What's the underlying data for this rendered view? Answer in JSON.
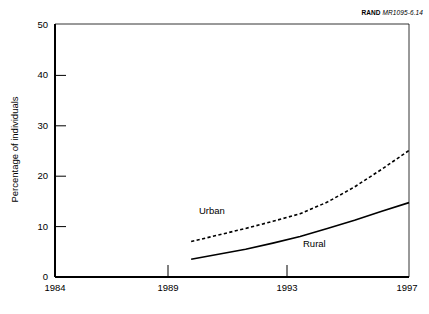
{
  "source_credit": {
    "organization": "RAND",
    "figure_id": "MR1095-6.14"
  },
  "axes": {
    "ylabel": "Percentage of individuals",
    "xlabel": "",
    "y_ticks": [
      "0",
      "10",
      "20",
      "30",
      "40",
      "50"
    ],
    "x_ticks": [
      "1984",
      "1989",
      "1993",
      "1997"
    ]
  },
  "labels": {
    "urban": "Urban",
    "rural": "Rural"
  },
  "colors": {
    "line": "#000000",
    "axis": "#000000",
    "background": "#ffffff"
  },
  "chart_data": {
    "type": "line",
    "title": "",
    "subtitle": "",
    "xlabel": "",
    "ylabel": "Percentage of individuals",
    "xlim": [
      1984,
      1997
    ],
    "ylim": [
      0,
      50
    ],
    "x_ticks": [
      1984,
      1989,
      1993,
      1997
    ],
    "y_ticks": [
      0,
      10,
      20,
      30,
      40,
      50
    ],
    "grid": false,
    "legend": "inline-annotations",
    "annotations": [
      {
        "text": "Urban",
        "x": 1990.9,
        "y": 15.4
      },
      {
        "text": "Rural",
        "x": 1994.6,
        "y": 9.0
      }
    ],
    "series": [
      {
        "name": "Urban",
        "style": "dashed",
        "x": [
          1989,
          1990,
          1991,
          1992,
          1993,
          1994,
          1995,
          1996,
          1997
        ],
        "values": [
          7.0,
          8.3,
          9.6,
          11.0,
          12.5,
          14.8,
          17.8,
          21.3,
          25.0
        ]
      },
      {
        "name": "Rural",
        "style": "solid",
        "x": [
          1989,
          1990,
          1991,
          1992,
          1993,
          1994,
          1995,
          1996,
          1997
        ],
        "values": [
          3.5,
          4.5,
          5.5,
          6.7,
          8.0,
          9.6,
          11.2,
          13.0,
          14.7
        ]
      }
    ]
  }
}
